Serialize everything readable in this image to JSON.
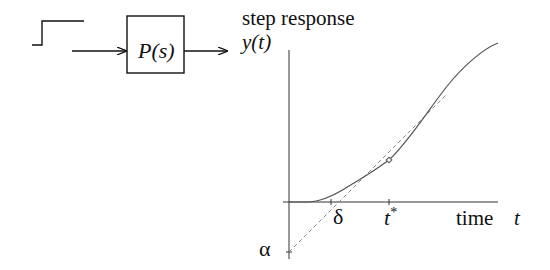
{
  "block": {
    "label": "P(s)"
  },
  "plot": {
    "title": "step response",
    "y_label": "y(t)",
    "x_label_word": "time",
    "x_label_symbol": "t",
    "delta_label": "δ",
    "tstar_label": "t",
    "tstar_sup": "*",
    "alpha_label": "α"
  },
  "colors": {
    "ink": "#111111",
    "curve": "#555555",
    "tangent": "#888888"
  }
}
